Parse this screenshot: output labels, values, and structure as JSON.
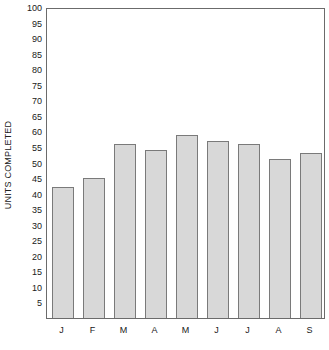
{
  "chart_data": {
    "type": "bar",
    "title": "",
    "xlabel": "",
    "ylabel": "UNITS COMPLETED",
    "categories": [
      "J",
      "F",
      "M",
      "A",
      "M",
      "J",
      "J",
      "A",
      "S"
    ],
    "values": [
      42,
      45,
      56,
      54,
      59,
      57,
      56,
      51,
      53
    ],
    "ylim": [
      0,
      100
    ],
    "ytick_labels": [
      "100",
      "95",
      "90",
      "85",
      "80",
      "75",
      "70",
      "65",
      "60",
      "55",
      "50",
      "45",
      "40",
      "35",
      "30",
      "25",
      "20",
      "15",
      "10",
      "5"
    ],
    "ytick_values": [
      100,
      95,
      90,
      85,
      80,
      75,
      70,
      65,
      60,
      55,
      50,
      45,
      40,
      35,
      30,
      25,
      20,
      15,
      10,
      5
    ],
    "ytick_step": 5,
    "grid": false,
    "legend": null,
    "series": [
      {
        "name": "Units Completed",
        "values": [
          42,
          45,
          56,
          54,
          59,
          57,
          56,
          51,
          53
        ]
      }
    ],
    "colors": {
      "bar_fill": "#d8d8d8",
      "bar_border": "#7a7a7a",
      "frame": "#6b6b6b",
      "background": "#ffffff",
      "text": "#202020"
    }
  }
}
